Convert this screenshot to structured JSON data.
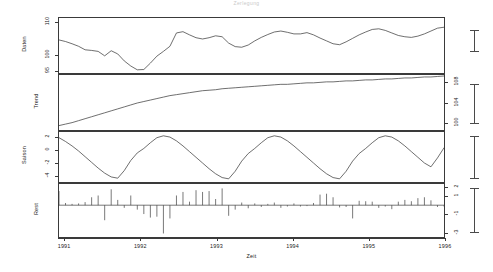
{
  "title": "Zerlegung",
  "axes": {
    "x": {
      "label": "Zeit",
      "ticks": [
        "1991",
        "1992",
        "1993",
        "1994",
        "1995",
        "1996"
      ],
      "range": [
        1991,
        1996
      ]
    }
  },
  "chart_data": {
    "type": "line",
    "title": "Zerlegung",
    "xlabel": "Zeit",
    "x_ticks": [
      1991,
      1992,
      1993,
      1994,
      1995,
      1996
    ],
    "xlim": [
      1990.92,
      1996.0
    ],
    "grid": false,
    "legend": null,
    "panels": [
      {
        "name": "daten-panel",
        "ylabel": "Daten",
        "axis_side": "left",
        "ytick_labels": [
          "110",
          "100",
          "95"
        ],
        "ytick_values": [
          110,
          100,
          95
        ],
        "ylim": [
          94.2,
          111.5
        ],
        "series_type": "line",
        "series": [
          {
            "name": "Daten",
            "values": [
              104.6,
              104.1,
              103.4,
              102.6,
              101.5,
              101.3,
              101.0,
              99.6,
              101.2,
              100.2,
              98.0,
              96.4,
              95.2,
              95.3,
              97.3,
              99.5,
              101.0,
              102.6,
              106.8,
              107.2,
              106.2,
              105.3,
              104.9,
              105.3,
              105.9,
              105.6,
              103.6,
              102.5,
              102.3,
              103.0,
              104.3,
              105.4,
              106.3,
              107.1,
              107.4,
              107.0,
              106.5,
              106.5,
              106.9,
              106.2,
              105.2,
              104.3,
              103.4,
              103.1,
              104.0,
              105.1,
              106.2,
              107.1,
              107.9,
              108.1,
              107.6,
              106.8,
              106.0,
              105.6,
              105.4,
              105.8,
              106.5,
              107.4,
              108.3,
              108.6
            ]
          }
        ]
      },
      {
        "name": "trend-panel",
        "ylabel": "Trend",
        "axis_side": "right",
        "ytick_labels": [
          "108",
          "104",
          "100"
        ],
        "ytick_values": [
          108,
          104,
          100
        ],
        "ylim": [
          98.4,
          109.6
        ],
        "series_type": "line",
        "series": [
          {
            "name": "Trend",
            "values": [
              99.3,
              99.6,
              99.9,
              100.3,
              100.7,
              101.1,
              101.5,
              101.9,
              102.3,
              102.7,
              103.1,
              103.5,
              103.9,
              104.2,
              104.5,
              104.8,
              105.1,
              105.4,
              105.6,
              105.8,
              106.0,
              106.2,
              106.4,
              106.5,
              106.6,
              106.8,
              106.9,
              107.0,
              107.1,
              107.2,
              107.3,
              107.4,
              107.5,
              107.6,
              107.7,
              107.7,
              107.8,
              107.9,
              108.0,
              108.0,
              108.1,
              108.2,
              108.2,
              108.3,
              108.4,
              108.4,
              108.5,
              108.6,
              108.6,
              108.7,
              108.8,
              108.8,
              108.9,
              109.0,
              109.0,
              109.1,
              109.2,
              109.2,
              109.3,
              109.4
            ]
          }
        ]
      },
      {
        "name": "saison-panel",
        "ylabel": "Saison",
        "axis_side": "left",
        "ytick_labels": [
          "2",
          "0",
          "-2",
          "-4"
        ],
        "ytick_values": [
          2,
          0,
          -2,
          -4
        ],
        "ylim": [
          -5.0,
          2.9
        ],
        "series_type": "line",
        "series": [
          {
            "name": "Saison",
            "values": [
              2.0,
              1.4,
              0.7,
              -0.1,
              -1.0,
              -1.9,
              -2.8,
              -3.6,
              -4.2,
              -4.4,
              -3.2,
              -1.6,
              -0.4,
              0.3,
              1.2,
              2.0,
              2.3,
              2.1,
              1.5,
              0.7,
              -0.2,
              -1.1,
              -2.0,
              -2.9,
              -3.7,
              -4.3,
              -4.5,
              -3.3,
              -1.7,
              -0.5,
              0.3,
              1.2,
              2.0,
              2.3,
              2.1,
              1.5,
              0.7,
              -0.2,
              -1.1,
              -2.0,
              -2.9,
              -3.7,
              -4.3,
              -4.5,
              -3.3,
              -1.7,
              -0.5,
              0.3,
              1.2,
              2.0,
              2.3,
              2.1,
              1.5,
              0.7,
              -0.2,
              -1.1,
              -2.0,
              -2.6,
              -1.2,
              0.4
            ]
          }
        ]
      },
      {
        "name": "rest-panel",
        "ylabel": "Rest",
        "axis_side": "right",
        "ytick_labels": [
          "2",
          "1",
          "-1",
          "-3"
        ],
        "ytick_values": [
          2,
          1,
          -1,
          -3
        ],
        "ylim": [
          -3.6,
          2.4
        ],
        "series_type": "stem",
        "series": [
          {
            "name": "Rest",
            "values": [
              1.6,
              0.25,
              0.15,
              0.2,
              0.35,
              0.9,
              1.1,
              -1.7,
              1.8,
              0.6,
              -0.3,
              1.1,
              -0.5,
              -1.0,
              -1.4,
              -1.3,
              -3.2,
              -1.5,
              1.1,
              1.5,
              0.4,
              1.7,
              1.5,
              1.6,
              0.7,
              1.9,
              -1.2,
              -0.5,
              0.3,
              -0.35,
              0.2,
              -0.2,
              0.15,
              0.3,
              -0.3,
              -0.15,
              0.2,
              -0.15,
              -0.1,
              0.25,
              1.2,
              1.3,
              0.9,
              -0.25,
              -0.2,
              -1.5,
              0.5,
              0.45,
              0.4,
              -0.3,
              -0.15,
              -0.45,
              0.4,
              0.6,
              0.45,
              0.8,
              0.9,
              0.55,
              -0.2,
              -0.15
            ]
          }
        ]
      }
    ],
    "reference_bars": [
      {
        "panel": "daten-panel",
        "label": ""
      },
      {
        "panel": "trend-panel",
        "label": ""
      },
      {
        "panel": "saison-panel",
        "label": ""
      },
      {
        "panel": "rest-panel",
        "label": ""
      }
    ]
  }
}
